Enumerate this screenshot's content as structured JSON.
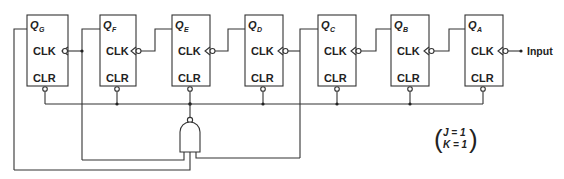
{
  "diagram": {
    "type": "ripple counter (mod-N reset via NAND)",
    "flip_flops": [
      {
        "id": "G",
        "q_label": "Q",
        "q_sub": "G",
        "clk_label": "CLK",
        "clr_label": "CLR"
      },
      {
        "id": "F",
        "q_label": "Q",
        "q_sub": "F",
        "clk_label": "CLK",
        "clr_label": "CLR"
      },
      {
        "id": "E",
        "q_label": "Q",
        "q_sub": "E",
        "clk_label": "CLK",
        "clr_label": "CLR"
      },
      {
        "id": "D",
        "q_label": "Q",
        "q_sub": "D",
        "clk_label": "CLK",
        "clr_label": "CLR"
      },
      {
        "id": "C",
        "q_label": "Q",
        "q_sub": "C",
        "clk_label": "CLK",
        "clr_label": "CLR"
      },
      {
        "id": "B",
        "q_label": "Q",
        "q_sub": "B",
        "clk_label": "CLK",
        "clr_label": "CLR"
      },
      {
        "id": "A",
        "q_label": "Q",
        "q_sub": "A",
        "clk_label": "CLK",
        "clr_label": "CLR"
      }
    ],
    "input_label": "Input",
    "gate": {
      "type": "NAND",
      "inputs": [
        "Q_G",
        "Q_F",
        "Q_C"
      ],
      "output": "CLR bus"
    },
    "annotation": {
      "line1": "J = 1",
      "line2": "K = 1"
    },
    "colors": {
      "stroke": "#333333",
      "background": "#ffffff"
    }
  }
}
